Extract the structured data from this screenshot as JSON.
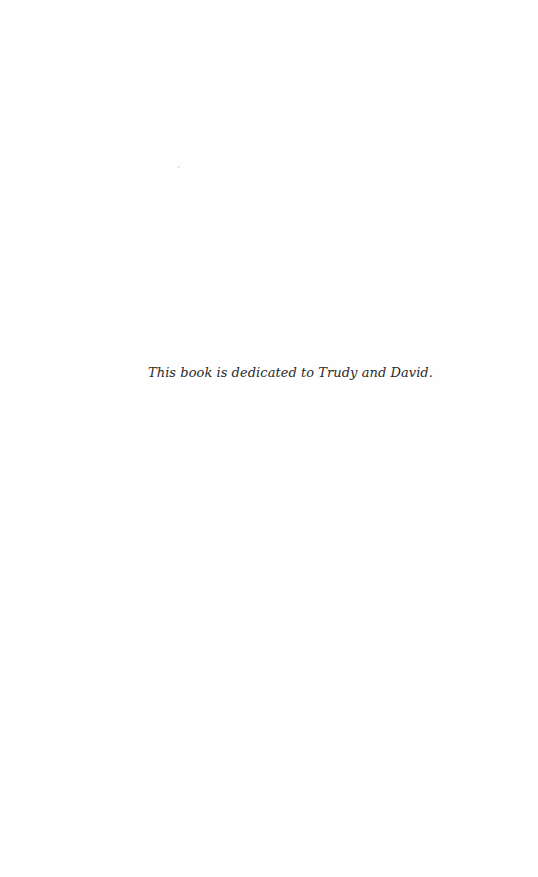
{
  "page": {
    "type": "dedication",
    "background_color": "#fefefe",
    "text_color": "#2a2a2a"
  },
  "dedication": {
    "text": "This book is dedicated to Trudy and David."
  }
}
